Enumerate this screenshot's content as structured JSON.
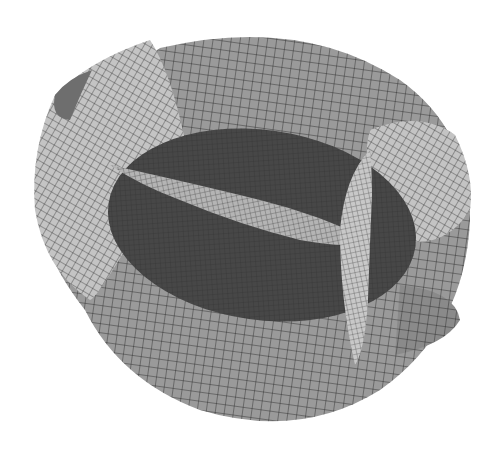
{
  "figure": {
    "type": "3d-wireframe-surface",
    "colors": {
      "background": "#ffffff",
      "outer_shell": "#9a9a9a",
      "outer_shell_light": "#c4c4c4",
      "inner_core": "#474747",
      "mesh_lines": "#1e1e1e"
    },
    "labels": []
  }
}
